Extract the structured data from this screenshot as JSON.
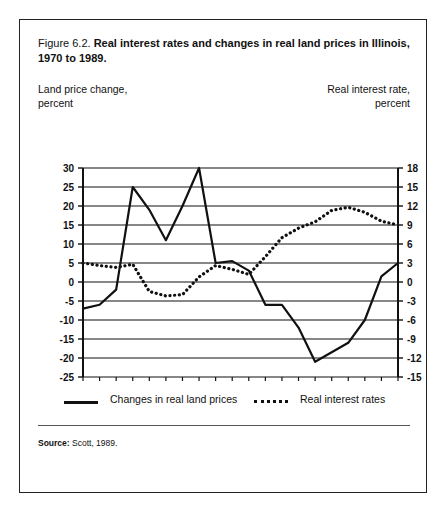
{
  "figure": {
    "number": "Figure 6.2.",
    "title": "Real interest rates and changes in real land prices in Illinois, 1970 to 1989.",
    "left_axis_label_line1": "Land price change,",
    "left_axis_label_line2": "percent",
    "right_axis_label_line1": "Real interest rate,",
    "right_axis_label_line2": "percent",
    "source_label": "Source:",
    "source_text": "Scott, 1989."
  },
  "legend": {
    "items": [
      {
        "label": "Changes in real land prices",
        "style": "solid",
        "color": "#111111"
      },
      {
        "label": "Real interest rates",
        "style": "dotted",
        "color": "#111111"
      }
    ]
  },
  "chart_data": {
    "type": "line",
    "title": "Real interest rates and changes in real land prices in Illinois, 1970 to 1989.",
    "xlabel": "",
    "ylabel": "Land price change, percent",
    "y2label": "Real interest rate, percent",
    "x": [
      1970,
      1971,
      1972,
      1973,
      1974,
      1975,
      1976,
      1977,
      1978,
      1979,
      1980,
      1981,
      1982,
      1983,
      1984,
      1985,
      1986,
      1987,
      1988,
      1989
    ],
    "xlim": [
      1970,
      1989
    ],
    "ylim": [
      -25,
      30
    ],
    "y2lim": [
      -15,
      18
    ],
    "yticks": [
      -25,
      -20,
      -15,
      -10,
      -5,
      0,
      5,
      10,
      15,
      20,
      25,
      30
    ],
    "y2ticks": [
      -15,
      -12,
      -9,
      -6,
      -3,
      0,
      3,
      6,
      9,
      12,
      15,
      18
    ],
    "xticks": [
      1970,
      1975,
      1980,
      1985,
      1989
    ],
    "xtick_labels": [
      "1970",
      "1975",
      "1980",
      "1985",
      "1989"
    ],
    "grid": true,
    "legend_position": "below",
    "series": [
      {
        "name": "Changes in real land prices",
        "axis": "left",
        "style": "solid",
        "values": [
          -7.0,
          -6.0,
          -2.0,
          25.0,
          19.0,
          11.0,
          20.0,
          30.0,
          5.0,
          5.5,
          3.0,
          -6.0,
          -6.0,
          -12.0,
          -21.0,
          -18.5,
          -16.0,
          -10.0,
          1.5,
          5.0
        ]
      },
      {
        "name": "Real interest rates",
        "axis": "right",
        "style": "dotted",
        "values": [
          3.0,
          2.6,
          2.3,
          2.8,
          -1.5,
          -2.2,
          -2.0,
          0.8,
          2.6,
          2.0,
          1.2,
          4.0,
          7.0,
          8.5,
          9.5,
          11.3,
          11.8,
          11.0,
          9.6,
          9.0
        ]
      }
    ]
  }
}
